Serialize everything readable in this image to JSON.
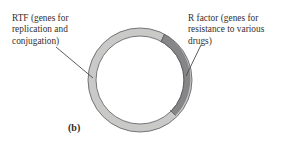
{
  "figure": {
    "panel_letter": "(b)",
    "background_color": "#ffffff"
  },
  "labels": {
    "left": {
      "text": "RTF (genes for\nreplication and\nconjugation)",
      "icon": "leader-line-icon"
    },
    "right": {
      "text": "R factor (genes for\nresistance to various\ndrugs)",
      "icon": "leader-line-icon"
    }
  },
  "diagram": {
    "type": "circular-plasmid-map",
    "center": {
      "x": 140,
      "y": 80
    },
    "outer_radius": 52,
    "inner_radius": 44,
    "segments": [
      {
        "name": "rtf-segment",
        "label": "RTF (genes for replication and conjugation)",
        "fill": "#c9c9c7",
        "stroke": "#58565a",
        "start_angle_deg": -62,
        "end_angle_deg": 243
      },
      {
        "name": "r-factor-segment",
        "label": "R factor (genes for resistance to various drugs)",
        "fill": "#868688",
        "stroke": "#58565a",
        "start_angle_deg": -62,
        "end_angle_deg": 47
      }
    ],
    "interior_fill": "#ffffff"
  },
  "colors": {
    "light_band": "#c9c9c7",
    "dark_band": "#868688",
    "outline": "#58565a",
    "text": "#332f2d",
    "leader_line": "#4a4a4c"
  }
}
